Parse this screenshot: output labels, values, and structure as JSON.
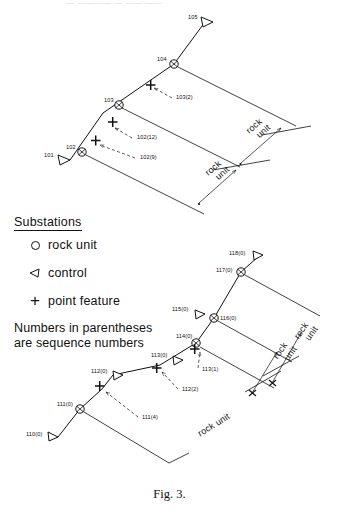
{
  "runhead": "— ————  —  —— ——",
  "figure": {
    "caption": "Fig. 3.",
    "legend": {
      "title": "Substations",
      "items": [
        {
          "symbol": "rock-unit-circle",
          "label": "rock unit"
        },
        {
          "symbol": "control-triangle",
          "label": "control"
        },
        {
          "symbol": "point-feature-plus",
          "label": "point feature"
        }
      ],
      "note_line1": "Numbers in parentheses",
      "note_line2": "are  sequence numbers"
    },
    "upper_traverse": {
      "nodes": [
        {
          "id": "101",
          "text": "101",
          "type": "control"
        },
        {
          "id": "102",
          "text": "102",
          "type": "rock-unit"
        },
        {
          "id": "103",
          "text": "103",
          "type": "rock-unit"
        },
        {
          "id": "104",
          "text": "104",
          "type": "rock-unit"
        },
        {
          "id": "105",
          "text": "105",
          "type": "control"
        }
      ],
      "feature_labels": [
        {
          "text": "103(2)"
        },
        {
          "text": "102(12)"
        },
        {
          "text": "102(9)"
        }
      ],
      "dimension_labels": [
        {
          "line1": "rock",
          "line2": "unit"
        },
        {
          "line1": "rock",
          "line2": "unit"
        }
      ]
    },
    "lower_traverse": {
      "nodes": [
        {
          "id": "110",
          "text": "110(0)",
          "type": "control"
        },
        {
          "id": "111",
          "text": "111(0)",
          "type": "rock-unit"
        },
        {
          "id": "112",
          "text": "112(0)",
          "type": "control"
        },
        {
          "id": "113",
          "text": "113(0)",
          "type": "control"
        },
        {
          "id": "114",
          "text": "114(0)",
          "type": "rock-unit"
        },
        {
          "id": "115",
          "text": "115(0)",
          "type": "control"
        },
        {
          "id": "116",
          "text": "116(0)",
          "type": "rock-unit"
        },
        {
          "id": "117",
          "text": "117(0)",
          "type": "rock-unit"
        },
        {
          "id": "118",
          "text": "118(0)",
          "type": "control"
        }
      ],
      "feature_labels": [
        {
          "text": "113(1)"
        },
        {
          "text": "112(2)"
        },
        {
          "text": "111(4)"
        }
      ],
      "dimension_labels": [
        {
          "line1": "rock",
          "line2": "unit"
        },
        {
          "line1": "rock",
          "line2": "unit"
        },
        {
          "text": "rock unit"
        }
      ]
    }
  },
  "colors": {
    "ink": "#111111",
    "paper": "#ffffff",
    "faint": "#b9b9b9"
  }
}
